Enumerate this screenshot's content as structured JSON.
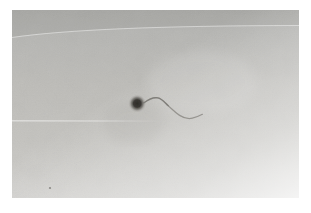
{
  "image": {
    "description": "Monochrome photograph of a single sperm-like specimen: a small dark round head with a thin S-curved tail trailing to the right, centered slightly left on a light gray textured paper background with a white border",
    "subject": {
      "head": {
        "cx": "125.2",
        "cy": "93.5",
        "r": "9",
        "core_color": "#2e2c29",
        "mid_color": "#3b3935"
      },
      "tail": {
        "path": "M132,92.8 C136.5,89.5 141.5,87.1 145.8,87.9 C150.3,88.8 152.3,92.2 156.3,95.8 C160.8,99.8 163.2,102.6 167.6,105.4 C171.8,108.1 176.4,109.2 180.4,108.2 C183.9,107.3 187.6,105.8 190.4,104.3",
        "near_head_path": "M132,92.8 C136.5,89.5 141.5,87.1 145.8,87.9 C150.3,88.8 152.3,92.2 156.3,95.8",
        "color": "#8d8b86",
        "near_head_color": "#6f6d68"
      },
      "shadow_smudge_color": "#6f6d68"
    },
    "background": {
      "frame_color": "#ffffff",
      "paper_top": "#aeaeac",
      "paper_upper": "#b5b5b2",
      "paper_mid": "#bdbcb8",
      "paper_lower": "#c4c3bf",
      "paper_bottom": "#d0cfcc",
      "crease_shade": "#5f5f5d",
      "streak_light": "#ffffff"
    },
    "artifacts": {
      "speck": {
        "cx": "38",
        "cy": "178",
        "r": "1.1",
        "color": "#6e6c68"
      }
    }
  }
}
